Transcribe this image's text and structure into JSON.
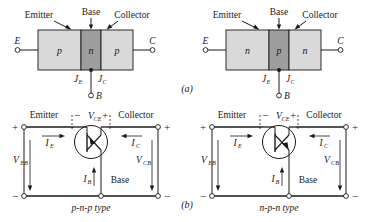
{
  "figure": {
    "caption_a": "(a)",
    "caption_b": "(b)",
    "panels": [
      {
        "id": "pnp-structure",
        "type_label_emitter": "Emitter",
        "type_label_base": "Base",
        "type_label_collector": "Collector",
        "terminal_left": "E",
        "terminal_right": "C",
        "terminal_bottom": "B",
        "region_left": "p",
        "region_mid": "n",
        "region_right": "p",
        "junction_left": "J",
        "junction_left_sub": "E",
        "junction_right": "J",
        "junction_right_sub": "C"
      },
      {
        "id": "npn-structure",
        "type_label_emitter": "Emitter",
        "type_label_base": "Base",
        "type_label_collector": "Collector",
        "terminal_left": "E",
        "terminal_right": "C",
        "terminal_bottom": "B",
        "region_left": "n",
        "region_mid": "p",
        "region_right": "n",
        "junction_left": "J",
        "junction_left_sub": "E",
        "junction_right": "J",
        "junction_right_sub": "C"
      },
      {
        "id": "pnp-circuit",
        "label_emitter": "Emitter",
        "label_collector": "Collector",
        "label_base": "Base",
        "v_ce": "V",
        "v_ce_sub": "CE",
        "v_ce_minus": "−",
        "v_ce_plus": "+",
        "i_e": "I",
        "i_e_sub": "E",
        "i_c": "I",
        "i_c_sub": "C",
        "i_b": "I",
        "i_b_sub": "B",
        "v_eb": "V",
        "v_eb_sub": "EB",
        "v_cb": "V",
        "v_cb_sub": "CB",
        "top_left_sign": "+",
        "top_right_sign": "+",
        "bottom_left_sign": "−",
        "bottom_right_sign": "−",
        "type_text": "p-n-p type"
      },
      {
        "id": "npn-circuit",
        "label_emitter": "Emitter",
        "label_collector": "Collector",
        "label_base": "Base",
        "v_ce": "V",
        "v_ce_sub": "CE",
        "v_ce_minus": "−",
        "v_ce_plus": "+",
        "i_e": "I",
        "i_e_sub": "E",
        "i_c": "I",
        "i_c_sub": "C",
        "i_b": "I",
        "i_b_sub": "B",
        "v_eb": "V",
        "v_eb_sub": "EB",
        "v_cb": "V",
        "v_cb_sub": "CB",
        "top_left_sign": "+",
        "top_right_sign": "+",
        "bottom_left_sign": "−",
        "bottom_right_sign": "−",
        "type_text": "n-p-n type"
      }
    ],
    "colors": {
      "line": "#1a1a1a",
      "region_light": "#d9d9d9",
      "region_dark": "#9e9e9e",
      "background": "#ffffff"
    }
  }
}
